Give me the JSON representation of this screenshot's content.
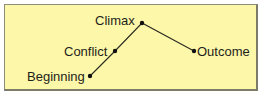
{
  "diagram": {
    "type": "story-arc",
    "background_color": "#fdf7a9",
    "line_color": "#2a2a22",
    "stages": [
      {
        "label": "Beginning",
        "x": 90,
        "y": 76
      },
      {
        "label": "Conflict",
        "x": 115,
        "y": 51
      },
      {
        "label": "Climax",
        "x": 142,
        "y": 23
      },
      {
        "label": "Outcome",
        "x": 194,
        "y": 51
      }
    ]
  }
}
